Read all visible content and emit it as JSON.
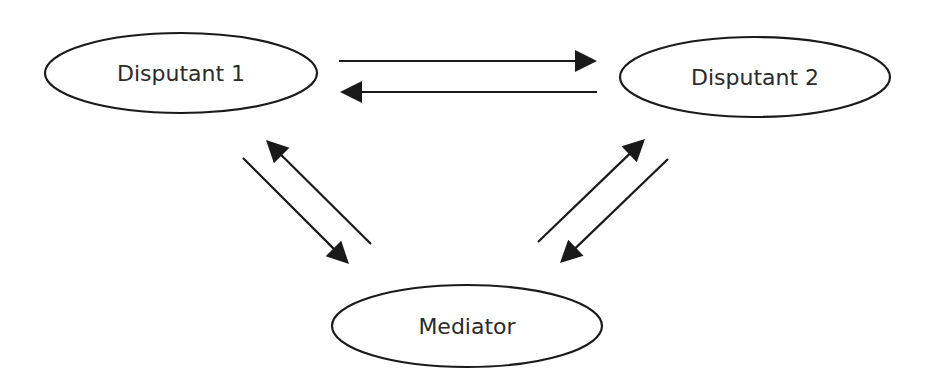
{
  "diagram": {
    "type": "mediation-triangle",
    "colors": {
      "stroke": "#1a1a1a",
      "text": "#2a2a2a",
      "background": "#ffffff"
    },
    "nodes": [
      {
        "id": "disputant1",
        "label": "Disputant 1",
        "cx": 181,
        "cy": 73,
        "rx": 136,
        "ry": 40
      },
      {
        "id": "disputant2",
        "label": "Disputant 2",
        "cx": 755,
        "cy": 77,
        "rx": 135,
        "ry": 40
      },
      {
        "id": "mediator",
        "label": "Mediator",
        "cx": 467,
        "cy": 326,
        "rx": 135,
        "ry": 41
      }
    ],
    "edges": [
      {
        "from": "disputant1",
        "to": "disputant2",
        "x1": 339,
        "y1": 61,
        "x2": 597,
        "y2": 61
      },
      {
        "from": "disputant2",
        "to": "disputant1",
        "x1": 597,
        "y1": 92,
        "x2": 340,
        "y2": 92
      },
      {
        "from": "disputant1",
        "to": "mediator",
        "x1": 243,
        "y1": 158,
        "x2": 349,
        "y2": 264
      },
      {
        "from": "mediator",
        "to": "disputant1",
        "x1": 371,
        "y1": 244,
        "x2": 266,
        "y2": 140
      },
      {
        "from": "mediator",
        "to": "disputant2",
        "x1": 538,
        "y1": 242,
        "x2": 645,
        "y2": 139
      },
      {
        "from": "disputant2",
        "to": "mediator",
        "x1": 668,
        "y1": 159,
        "x2": 560,
        "y2": 263
      }
    ]
  }
}
